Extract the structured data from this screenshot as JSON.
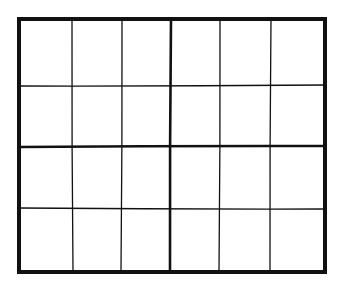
{
  "diagram": {
    "type": "grid",
    "columns": 6,
    "rows": 4,
    "colors": {
      "line": "#111111",
      "background": "#ffffff"
    },
    "outer_box": {
      "x1": 19,
      "y1": 19,
      "x2": 325,
      "y2": 272,
      "stroke": 4
    },
    "vertical_lines": [
      {
        "x_top": 72,
        "x_bottom": 73,
        "stroke": 1.3,
        "role": "minor"
      },
      {
        "x_top": 122,
        "x_bottom": 121,
        "stroke": 1.3,
        "role": "minor"
      },
      {
        "x_top": 171,
        "x_bottom": 170,
        "stroke": 2.6,
        "role": "center"
      },
      {
        "x_top": 220,
        "x_bottom": 219,
        "stroke": 1.3,
        "role": "minor"
      },
      {
        "x_top": 271,
        "x_bottom": 270,
        "stroke": 1.3,
        "role": "minor"
      }
    ],
    "horizontal_lines": [
      {
        "y_left": 86,
        "y_right": 85,
        "stroke": 1.3,
        "role": "minor"
      },
      {
        "y_left": 147,
        "y_right": 146,
        "stroke": 2.6,
        "role": "center"
      },
      {
        "y_left": 208,
        "y_right": 209,
        "stroke": 1.3,
        "role": "minor"
      }
    ]
  }
}
